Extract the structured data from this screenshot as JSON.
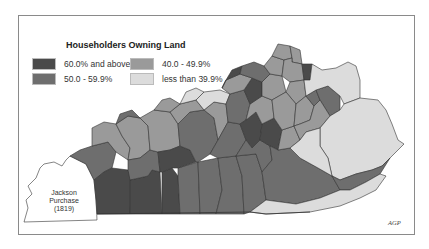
{
  "map": {
    "title": "Householders Owning Land",
    "credit": "AGP",
    "legend": [
      {
        "label": "60.0% and above",
        "color": "#4a4a4a"
      },
      {
        "label": "50.0 - 59.9%",
        "color": "#6e6e6e"
      },
      {
        "label": "40.0 - 49.9%",
        "color": "#9a9a9a"
      },
      {
        "label": "less than 39.9%",
        "color": "#dcdcdc"
      }
    ],
    "region_label": {
      "line1": "Jackson",
      "line2": "Purchase",
      "line3": "(1819)"
    },
    "colors": {
      "dark": "#4a4a4a",
      "mid_dark": "#6e6e6e",
      "mid_light": "#9a9a9a",
      "light": "#dcdcdc",
      "border": "#333333",
      "unshaded": "#ffffff"
    }
  }
}
